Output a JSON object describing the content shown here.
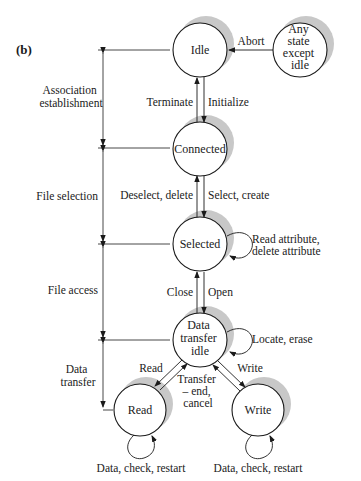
{
  "panel_label": "(b)",
  "colors": {
    "line": "#1a1a1a",
    "shadow": "#c8c8c8",
    "background": "#ffffff"
  },
  "states": {
    "idle": {
      "label": "Idle"
    },
    "any_state": {
      "lines": [
        "Any",
        "state",
        "except",
        "idle"
      ]
    },
    "connected": {
      "label": "Connected"
    },
    "selected": {
      "label": "Selected"
    },
    "data_transfer_idle": {
      "lines": [
        "Data",
        "transfer",
        "idle"
      ]
    },
    "read": {
      "label": "Read"
    },
    "write": {
      "label": "Write"
    }
  },
  "transitions": {
    "abort": "Abort",
    "terminate": "Terminate",
    "initialize": "Initialize",
    "deselect_delete": "Deselect, delete",
    "select_create": "Select, create",
    "selected_loop": [
      "Read attribute,",
      "delete attribute"
    ],
    "close": "Close",
    "open": "Open",
    "dti_loop": "Locate, erase",
    "read": "Read",
    "write": "Write",
    "transfer_end": [
      "Transfer",
      "– end,",
      "cancel"
    ],
    "read_loop": "Data, check, restart",
    "write_loop": "Data, check, restart"
  },
  "phases": [
    {
      "lines": [
        "Association",
        "establishment"
      ]
    },
    {
      "lines": [
        "File selection"
      ]
    },
    {
      "lines": [
        "File access"
      ]
    },
    {
      "lines": [
        "Data",
        "transfer"
      ]
    }
  ]
}
